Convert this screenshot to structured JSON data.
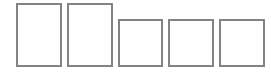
{
  "boxes": [
    {
      "shape": "portrait",
      "x": 16,
      "y": 3,
      "w": 46,
      "h": 64
    },
    {
      "shape": "portrait",
      "x": 67,
      "y": 3,
      "w": 46,
      "h": 64
    },
    {
      "shape": "square",
      "x": 118,
      "y": 19,
      "w": 45,
      "h": 48
    },
    {
      "shape": "square",
      "x": 168,
      "y": 19,
      "w": 46,
      "h": 48
    },
    {
      "shape": "square",
      "x": 219,
      "y": 19,
      "w": 46,
      "h": 48
    }
  ],
  "colors": {
    "border": "#838383",
    "fill": "#fefefe",
    "background": "#ffffff"
  }
}
